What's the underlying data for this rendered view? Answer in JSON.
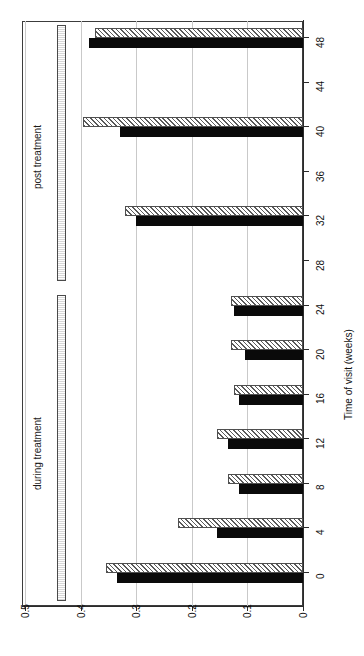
{
  "chart_data": {
    "type": "bar",
    "orientation": "horizontal",
    "title": "",
    "xlabel": "Time of visit (weeks)",
    "ylabel": "",
    "categories": [
      0,
      4,
      8,
      12,
      16,
      20,
      24,
      28,
      32,
      36,
      40,
      44,
      48
    ],
    "value_axis": {
      "min": 0,
      "max": 0.5,
      "ticks": [
        "0.5",
        "0.4",
        "0.3",
        "0.2",
        "0.1",
        "0"
      ],
      "tick_values": [
        0.5,
        0.4,
        0.3,
        0.2,
        0.1,
        0
      ],
      "direction": "right-to-left",
      "grid": true
    },
    "series": [
      {
        "name": "hatched",
        "style": "hatched",
        "values": [
          0.355,
          0.225,
          0.135,
          0.155,
          0.125,
          0.13,
          0.13,
          0,
          0.32,
          0,
          0.395,
          0,
          0.375
        ]
      },
      {
        "name": "solid",
        "style": "solid",
        "values": [
          0.335,
          0.155,
          0.115,
          0.135,
          0.115,
          0.105,
          0.125,
          0,
          0.3,
          0,
          0.33,
          0,
          0.385
        ]
      }
    ],
    "annotations": [
      {
        "label": "during treatment",
        "from_week": 0,
        "to_week": 26
      },
      {
        "label": "post treatment",
        "from_week": 27,
        "to_week": 50
      }
    ],
    "legend": {
      "visible": false,
      "position": "none"
    }
  },
  "axis": {
    "category_title": "Time of visit (weeks)",
    "category_ticks": [
      "0",
      "4",
      "8",
      "12",
      "16",
      "20",
      "24",
      "28",
      "32",
      "36",
      "40",
      "44",
      "48"
    ],
    "value_ticks": [
      "0.5",
      "0.4",
      "0.3",
      "0.2",
      "0.1",
      "0"
    ]
  },
  "brackets": {
    "during": "during treatment",
    "post": "post treatment"
  }
}
